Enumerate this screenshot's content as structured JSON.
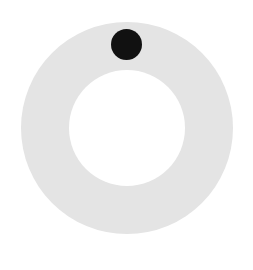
{
  "dial": {
    "ring_color": "#e4e4e4",
    "knob_color": "#111111",
    "knob_position": "top"
  }
}
